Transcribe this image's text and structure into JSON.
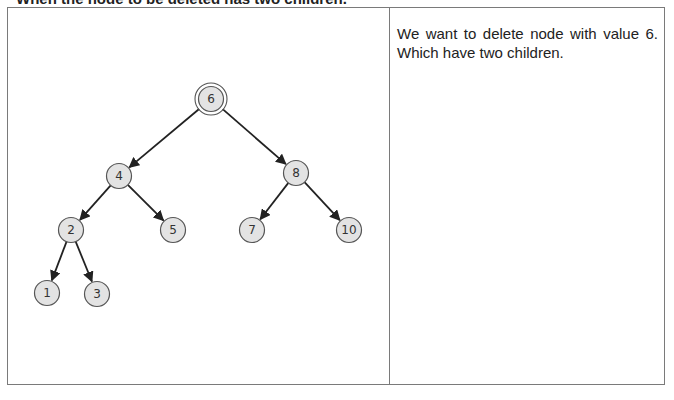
{
  "heading": {
    "text": "When the node to be deleted has two children.",
    "note": "partially clipped at top edge; wording inferred"
  },
  "explanation": {
    "line1": "We want to delete node with value 6.",
    "line2": "Which have two children."
  },
  "tree": {
    "highlighted_node": "6",
    "nodes": [
      {
        "id": "n6",
        "label": "6",
        "x": 203,
        "y": 91,
        "highlight": true
      },
      {
        "id": "n4",
        "label": "4",
        "x": 111,
        "y": 168
      },
      {
        "id": "n8",
        "label": "8",
        "x": 288,
        "y": 165
      },
      {
        "id": "n2",
        "label": "2",
        "x": 63,
        "y": 222
      },
      {
        "id": "n5",
        "label": "5",
        "x": 165,
        "y": 222
      },
      {
        "id": "n7",
        "label": "7",
        "x": 244,
        "y": 222
      },
      {
        "id": "n10",
        "label": "10",
        "x": 341,
        "y": 222
      },
      {
        "id": "n1",
        "label": "1",
        "x": 39,
        "y": 285
      },
      {
        "id": "n3",
        "label": "3",
        "x": 89,
        "y": 286
      }
    ],
    "edges": [
      [
        "n6",
        "n4"
      ],
      [
        "n6",
        "n8"
      ],
      [
        "n4",
        "n2"
      ],
      [
        "n4",
        "n5"
      ],
      [
        "n8",
        "n7"
      ],
      [
        "n8",
        "n10"
      ],
      [
        "n2",
        "n1"
      ],
      [
        "n2",
        "n3"
      ]
    ]
  }
}
